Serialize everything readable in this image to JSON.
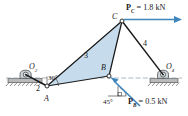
{
  "figure": {
    "type": "four-bar-linkage-free-body-diagram",
    "background": "#ffffff",
    "colors": {
      "link_outline": "#1a1a1a",
      "coupler_fill": "#c6dced",
      "force_arrow": "#3f86bd",
      "ground_hatch": "#6b6b6b",
      "centerline": "#8a9aa6"
    },
    "joints": [
      {
        "id": "O2",
        "label": "O",
        "sub": "2",
        "x": 26,
        "y": 78,
        "kind": "ground-pivot"
      },
      {
        "id": "A",
        "label": "A",
        "sub": "",
        "x": 47,
        "y": 86,
        "kind": "pin-joint"
      },
      {
        "id": "B",
        "label": "B",
        "sub": "",
        "x": 109,
        "y": 76,
        "kind": "pin-joint"
      },
      {
        "id": "C",
        "label": "C",
        "sub": "",
        "x": 122,
        "y": 21,
        "kind": "pin-joint"
      },
      {
        "id": "O4",
        "label": "O",
        "sub": "4",
        "x": 163,
        "y": 78,
        "kind": "ground-pivot"
      }
    ],
    "links": [
      {
        "id": "2",
        "label": "2",
        "from": "O2",
        "to": "A",
        "label_x": 38,
        "label_y": 90
      },
      {
        "id": "3",
        "label": "3",
        "nodes": [
          "A",
          "C",
          "B"
        ],
        "label_x": 86,
        "label_y": 57
      },
      {
        "id": "4",
        "label": "4",
        "from": "C",
        "to": "O4",
        "label_x": 145,
        "label_y": 45
      }
    ],
    "angles": [
      {
        "id": "crank-angle",
        "label": "30",
        "unit": "°",
        "at": "A",
        "label_x": 44,
        "label_y": 79
      },
      {
        "id": "load-angle",
        "label": "45",
        "unit": "°",
        "at": "B",
        "label_x": 110,
        "label_y": 99
      }
    ],
    "forces": [
      {
        "id": "PC",
        "symbol": "P",
        "sub": "C",
        "equals": "=",
        "magnitude": "1.8",
        "unit": "kN",
        "text": "P_C = 1.8 kN",
        "applied_at": "C",
        "direction": "horizontal-right",
        "label_x": 128,
        "label_y": 10
      },
      {
        "id": "PB",
        "symbol": "P",
        "sub": "B",
        "equals": "=",
        "magnitude": "0.5",
        "unit": "kN",
        "text": "P_B = 0.5 kN",
        "applied_at": "B",
        "direction": "45-deg-up-left",
        "label_x": 131,
        "label_y": 100
      }
    ],
    "supports": [
      {
        "id": "ground-left",
        "at": "O2",
        "x": 26,
        "y": 78
      },
      {
        "id": "ground-right",
        "at": "O4",
        "x": 163,
        "y": 78
      }
    ],
    "centerline": {
      "y": 78,
      "x1": 6,
      "x2": 182
    }
  }
}
